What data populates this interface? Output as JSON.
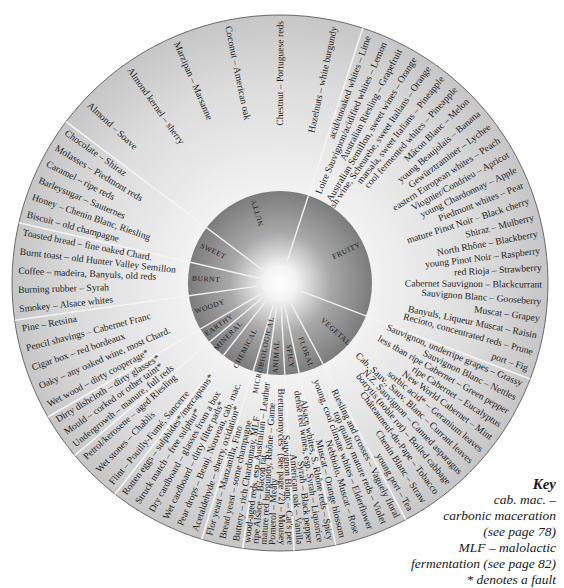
{
  "wheel": {
    "center": [
      280,
      283
    ],
    "outer_radius": 268,
    "inner_radius": 92,
    "colors": {
      "outer_ring": "#d4d4d4",
      "inner_disc_edge": "#8a8a8a",
      "inner_glow": "#ffffff",
      "divider": "#f4f4f4",
      "outline": "#555555"
    },
    "categories": [
      {
        "name": "FRUITY",
        "start": -72,
        "end": 21,
        "aromas": [
          "acid/unoaked whites – Lime",
          "Loire Sauvignon/acidified whites – Lemon",
          "Australian Riesling – Grapefruit",
          "Australian Semillon, sweet wines – Orange",
          "English wine, Scheurebe, sweet Italians – Orange",
          "marsala, sweet Italians – Pineapple",
          "cool fermented whites – Pineapple",
          "Mâcon Blanc – Melon",
          "young Beaujolais – Banana",
          "Gewürztraminer – Lychee",
          "eastern European whites – Peach",
          "Viognier/Condrieu – Apricot",
          "young Chardonnay – Apple",
          "Piedmont whites – Pear",
          "mature Pinot Noir – Black cherry",
          "Shiraz – Mulberry",
          "North Rhône – Blackberry",
          "young Pinot Noir – Raspberry",
          "red Rioja – Strawberry",
          "Cabernet Sauvignon – Blackcurrant",
          "Sauvignon Blanc – Gooseberry",
          "Muscat – Grapey",
          "Banyuls, Liqueur Muscat – Raisin",
          "Recioto, concentrated reds – Prune",
          "port – Fig"
        ]
      },
      {
        "name": "VEGETAL",
        "start": 21,
        "end": 62,
        "aromas": [
          "Sauvignon, underripe grapes – Grassy",
          "Sauvignon Blanc – Nettles",
          "less than ripe Cabernet – Green pepper",
          "ripe Cabernet – Eucalyptus",
          "New World Cabernet – Mint",
          "sorbic acid* – Geranium leaves",
          "Cab. Sauv., Sauv. Blanc – Currant leaves",
          "N.Z. Sauvignon – Canned asparagus",
          "botrytis (noble rot) – Boiled cabbage",
          "Châteauneuf-du-Pape – Tobacco",
          "Chenin Blanc – Straw",
          "young port – Tea"
        ]
      },
      {
        "name": "FLORAL",
        "start": 62,
        "end": 78,
        "aromas": [
          "Riesling and crosses – Vaguely floral",
          "top quality mature reds – Violet",
          "young, cool climate whites – Elderflower",
          "Nebbiolo, Muscat – Rose",
          "Muscat – Orange blossom"
        ]
      },
      {
        "name": "SPICY",
        "start": 78,
        "end": 87,
        "aromas": [
          "Alsace whites, S. Rhône reds – Spicy",
          "dense red wines, esp. Syrah – Liquorice",
          "Syrah – Black pepper",
          "American oak – Vanilla"
        ]
      },
      {
        "name": "ANIMAL",
        "start": 87,
        "end": 98,
        "aromas": [
          "Sauvignon Blanc – Cat's pee",
          "Brettanomyces* (see page 72) – Mousey",
          "Pomerol – Meaty",
          "mature red burgundy, Rhône – Game",
          "ripe Alsace – Bacon fat",
          "wood-aged reds, esp. Australian – Leather"
        ]
      },
      {
        "name": "MICROBIOLOGICAL",
        "start": 98,
        "end": 107,
        "aromas": [
          "Buttery – rich Chardonnay, MLF",
          "Bread yeast – some champagne",
          "Flor yeast – Manzanilla, Fino"
        ]
      },
      {
        "name": "CHEMICAL",
        "start": 107,
        "end": 128,
        "aromas": [
          "Acetaldehyde – sherry, oxidation*",
          "Pear drops – Beauj. Nouveau, cab. mac.",
          "Wet cardboard – dirty filter pads*",
          "Dry cardboard – glasses from a box",
          "Struck match – free sulphur*",
          "Rotten eggs – sulphides*/mercaptans*"
        ]
      },
      {
        "name": "MINERAL",
        "start": 128,
        "end": 140,
        "aromas": [
          "Flint – Pouilly-Fumé, Sancerre",
          "Wet stones – Chablis",
          "Petrol/kerosene – aged Riesling"
        ]
      },
      {
        "name": "EARTHY",
        "start": 140,
        "end": 150,
        "aromas": [
          "Undergrowth – manure, full reds",
          "Mould – corked or other taint*",
          "Dirty dishcloth – dirty glasses*"
        ]
      },
      {
        "name": "WOODY",
        "start": 150,
        "end": 172,
        "aromas": [
          "Wet wood – dirty cooperage*",
          "Oaky – any oaked wine, most Chard.",
          "Cigar box – red bordeaux",
          "Pencil shavings – Cabernet Franc",
          "Pine – Retsina"
        ]
      },
      {
        "name": "BURNT",
        "start": 172,
        "end": 193,
        "aromas": [
          "Smokey – Alsace whites",
          "Burning rubber – Syrah",
          "Coffee – madeira, Banyuls, old reds",
          "Burnt toast – old Hunter Valley Semillon",
          "Toasted bread – fine oaked Chard."
        ]
      },
      {
        "name": "SWEET",
        "start": 193,
        "end": 217,
        "aromas": [
          "Biscuit – old champagne",
          "Honey – Chenin Blanc, Riesling",
          "Barleysugar – Sauternes",
          "Caramel – ripe reds",
          "Molasses – Piedmont reds",
          "Chocolate – Shiraz"
        ]
      },
      {
        "name": "NUTTY",
        "start": 217,
        "end": 288,
        "aromas": [
          "Almond – Soave",
          "Almond kernel – sherry",
          "Marzipan – Marsanne",
          "Coconut – American oak",
          "Chestnut – Portuguese reds",
          "Hazelnuts – white burgundy"
        ]
      }
    ]
  },
  "key": {
    "title": "Key",
    "lines": [
      "cab. mac. –",
      "carbonic maceration",
      "(see page 78)",
      "MLF – malolactic",
      "fermentation (see page 82)",
      "* denotes a fault"
    ]
  }
}
